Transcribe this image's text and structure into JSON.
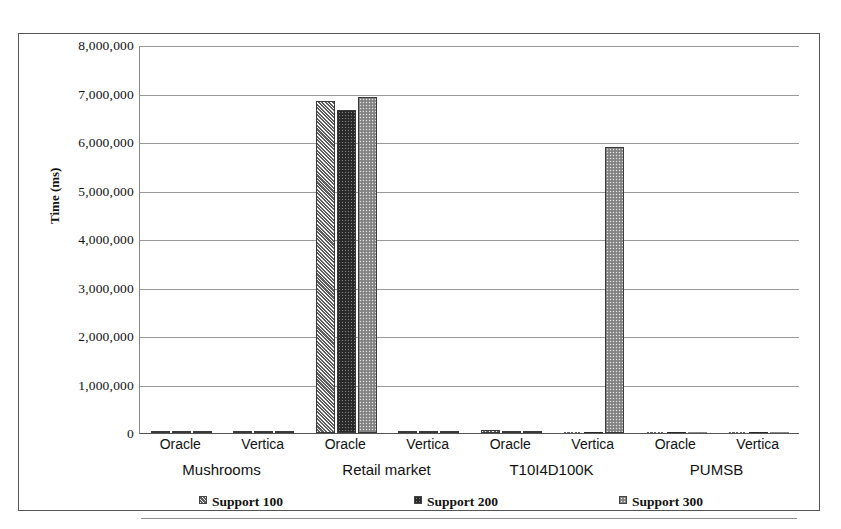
{
  "chart_data": {
    "type": "bar",
    "title": "",
    "xlabel": "",
    "ylabel": "Time (ms)",
    "ylim": [
      0,
      8000000
    ],
    "grid": true,
    "legend_position": "bottom",
    "categories": [
      "Mushrooms / Oracle",
      "Mushrooms / Vertica",
      "Retail market / Oracle",
      "Retail market / Vertica",
      "T10I4D100K / Oracle",
      "T10I4D100K / Vertica",
      "PUMSB / Oracle",
      "PUMSB / Vertica"
    ],
    "group_labels": [
      "Mushrooms",
      "Retail market",
      "T10I4D100K",
      "PUMSB"
    ],
    "subgroup_labels": [
      "Oracle",
      "Vertica"
    ],
    "ytick_labels": [
      "8,000,000",
      "7,000,000",
      "6,000,000",
      "5,000,000",
      "4,000,000",
      "3,000,000",
      "2,000,000",
      "1,000,000",
      "0"
    ],
    "ytick_values": [
      8000000,
      7000000,
      6000000,
      5000000,
      4000000,
      3000000,
      2000000,
      1000000,
      0
    ],
    "series": [
      {
        "name": "Support 100",
        "pattern": "light-grey-diagonal-hatch",
        "color": "#bdbdbd",
        "values": [
          12000,
          9000,
          6850000,
          4000,
          65000,
          0,
          0,
          0
        ]
      },
      {
        "name": "Support 200",
        "pattern": "dark-dotted",
        "color": "#2a2a2a",
        "values": [
          10000,
          28000,
          6650000,
          3000,
          8000,
          0,
          0,
          0
        ]
      },
      {
        "name": "Support 300",
        "pattern": "medium-grey-dotted",
        "color": "#8f8f8f",
        "values": [
          9000,
          12000,
          6920000,
          3000,
          6000,
          5900000,
          0,
          0
        ]
      }
    ]
  },
  "axis": {
    "y_title": "Time (ms)"
  },
  "legend": {
    "items": [
      {
        "label": "Support 100"
      },
      {
        "label": "Support 200"
      },
      {
        "label": "Support 300"
      }
    ]
  }
}
